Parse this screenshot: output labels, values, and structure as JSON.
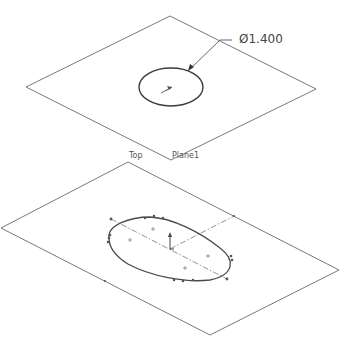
{
  "view": {
    "background": "#ffffff",
    "line_color": "#6a6a6a"
  },
  "upper_plane": {
    "label": "Plane1",
    "sketch": {
      "type": "circle",
      "dimension_text": "Ø1.400"
    }
  },
  "lower_plane": {
    "label": "Top",
    "sketch": {
      "type": "closed-spline"
    }
  }
}
